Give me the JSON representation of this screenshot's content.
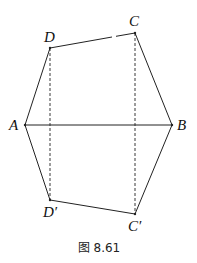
{
  "figure": {
    "caption": "图 8.61",
    "points": {
      "A": {
        "label": "A",
        "x": 25,
        "y": 125
      },
      "B": {
        "label": "B",
        "x": 172,
        "y": 125
      },
      "C": {
        "label": "C",
        "x": 135,
        "y": 33
      },
      "D": {
        "label": "D",
        "x": 50,
        "y": 48
      },
      "C_prime": {
        "label": "C′",
        "x": 135,
        "y": 214
      },
      "D_prime": {
        "label": "D′",
        "x": 50,
        "y": 200
      }
    },
    "solid_edges": [
      [
        "A",
        "D"
      ],
      [
        "D",
        "C"
      ],
      [
        "C",
        "B"
      ],
      [
        "A",
        "B"
      ],
      [
        "A",
        "D_prime"
      ],
      [
        "D_prime",
        "C_prime"
      ],
      [
        "C_prime",
        "B"
      ]
    ],
    "dashed_edges": [
      [
        "D",
        "D_prime"
      ],
      [
        "C",
        "C_prime"
      ]
    ]
  }
}
